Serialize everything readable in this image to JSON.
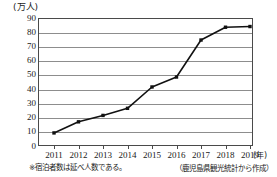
{
  "chart_data": {
    "type": "line",
    "title": "",
    "subtitle": "",
    "xlabel": "(年)",
    "ylabel": "(万人)",
    "categories": [
      "2011",
      "2012",
      "2013",
      "2014",
      "2015",
      "2016",
      "2017",
      "2018",
      "2019"
    ],
    "series": [
      {
        "name": "宿泊者数",
        "values": [
          9.2,
          17.0,
          21.5,
          26.5,
          41.5,
          48.5,
          74.5,
          83.5,
          84.0
        ]
      }
    ],
    "ylim": [
      0,
      90
    ],
    "ytick_step": 10,
    "yticks": [
      "90",
      "80",
      "70",
      "60",
      "50",
      "40",
      "30",
      "20",
      "10",
      "0"
    ],
    "grid": "horizontal",
    "legend": "none",
    "marker": "square",
    "line_color": "#111111",
    "grid_color": "#8d8d8d",
    "frame_color": "#4a4a4a"
  },
  "axes": {
    "y_unit_label": "(万人)",
    "x_unit_label": "(年)"
  },
  "notes": {
    "footnote": "※宿泊者数は延べ人数である。",
    "source": "（鹿児島県観光統計から作成）"
  }
}
